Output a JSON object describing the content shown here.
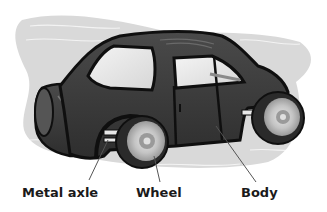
{
  "diagram": {
    "labels": [
      {
        "id": "metal-axle",
        "text": "Metal axle"
      },
      {
        "id": "wheel",
        "text": "Wheel"
      },
      {
        "id": "body",
        "text": "Body"
      }
    ],
    "colors": {
      "background_blob": "#d9d9d9",
      "car_body": "#3a3a3a",
      "car_outline": "#0f0f0f",
      "window": "#ececec",
      "wheel_tire": "#2a2a2a",
      "wheel_hub": "#c8c8c8",
      "leader_line": "#555555",
      "label_text": "#1a1a1a"
    }
  }
}
